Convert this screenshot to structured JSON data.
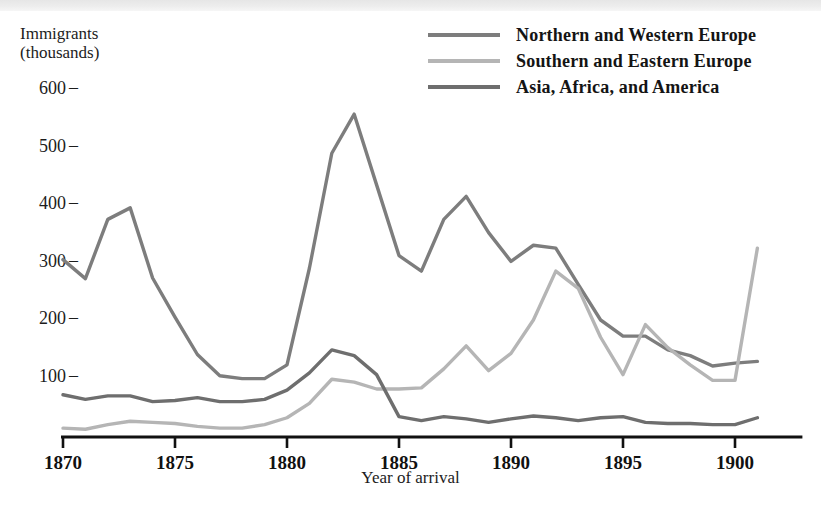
{
  "figure": {
    "y_axis_caption": "Immigrants\n(thousands)",
    "x_axis_title": "Year of arrival",
    "y_ticks": [
      "600",
      "500",
      "400",
      "300",
      "200",
      "100"
    ],
    "x_ticks": [
      "1870",
      "1875",
      "1880",
      "1885",
      "1890",
      "1895",
      "1900"
    ],
    "colors": {
      "northern_western": "#7d7d7d",
      "southern_eastern": "#b5b5b5",
      "asia_africa_america": "#6e6e6e",
      "axis": "#111111",
      "text": "#1a1a1a"
    }
  },
  "legend": {
    "position": "top-right",
    "items": [
      {
        "label": "Northern and Western Europe",
        "color": "#7d7d7d",
        "swatch": "legend-swatch-northern-western"
      },
      {
        "label": "Southern and Eastern Europe",
        "color": "#b5b5b5",
        "swatch": "legend-swatch-southern-eastern"
      },
      {
        "label": "Asia, Africa, and America",
        "color": "#6e6e6e",
        "swatch": "legend-swatch-asia-africa-america"
      }
    ]
  },
  "chart_data": {
    "type": "line",
    "title": "",
    "subtitle": "",
    "xlabel": "Year of arrival",
    "ylabel": "Immigrants (thousands)",
    "xlim": [
      1870,
      1901
    ],
    "ylim": [
      0,
      620
    ],
    "xticks": [
      1870,
      1875,
      1880,
      1885,
      1890,
      1895,
      1900
    ],
    "yticks": [
      100,
      200,
      300,
      400,
      500,
      600
    ],
    "grid": false,
    "legend_position": "top-right",
    "x": [
      1870,
      1871,
      1872,
      1873,
      1874,
      1875,
      1876,
      1877,
      1878,
      1879,
      1880,
      1881,
      1882,
      1883,
      1884,
      1885,
      1886,
      1887,
      1888,
      1889,
      1890,
      1891,
      1892,
      1893,
      1894,
      1895,
      1896,
      1897,
      1898,
      1899,
      1900,
      1901
    ],
    "series": [
      {
        "name": "Northern and Western Europe",
        "color": "#7d7d7d",
        "values": [
          305,
          272,
          375,
          395,
          273,
          205,
          140,
          103,
          98,
          98,
          122,
          290,
          490,
          558,
          435,
          312,
          285,
          375,
          415,
          352,
          302,
          330,
          325,
          262,
          200,
          172,
          172,
          148,
          138,
          120,
          125,
          128
        ]
      },
      {
        "name": "Southern and Eastern Europe",
        "color": "#b5b5b5",
        "values": [
          12,
          10,
          18,
          24,
          22,
          20,
          15,
          12,
          12,
          18,
          30,
          55,
          97,
          92,
          80,
          80,
          82,
          115,
          155,
          112,
          142,
          200,
          285,
          255,
          170,
          105,
          192,
          152,
          122,
          95,
          95,
          325
        ]
      },
      {
        "name": "Asia, Africa, and America",
        "color": "#6e6e6e",
        "values": [
          70,
          62,
          68,
          68,
          58,
          60,
          65,
          58,
          58,
          62,
          78,
          108,
          148,
          138,
          105,
          32,
          25,
          32,
          28,
          22,
          28,
          33,
          30,
          25,
          30,
          32,
          22,
          20,
          20,
          18,
          18,
          30
        ]
      }
    ]
  }
}
